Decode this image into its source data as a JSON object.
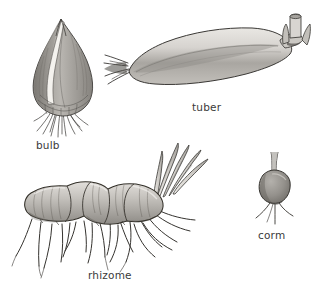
{
  "figure": {
    "background_color": "#ffffff",
    "label_color": "#3a3a3a",
    "ink_color": "#2b2b2b",
    "width": 313,
    "height": 290
  },
  "organs": [
    {
      "id": "bulb",
      "label": "bulb",
      "description": "Teardrop-shaped onion-like bulb with pointed apex, pale vertical split in the papery scales, and a dense tuft of fibrous roots at the flattened basal plate.",
      "fill_color": "#9a9a9a",
      "highlight_color": "#f2f0ec",
      "position": {
        "x": 30,
        "y": 18,
        "width": 62,
        "height": 122
      }
    },
    {
      "id": "tuber",
      "label": "tuber",
      "description": "Elongated horizontal swollen stem tuber with thin strap roots fanning from the left tip and short cut stem stubs rising at the upper right end.",
      "fill_color": "#c9c7c3",
      "highlight_color": "#eeece8",
      "position": {
        "x": 108,
        "y": 14,
        "width": 196,
        "height": 82
      }
    },
    {
      "id": "rhizome",
      "label": "rhizome",
      "description": "Horizontal segmented rhizome of three swollen internodes with constricted nodes, leaf shoots fanning up from the right tip, and many long wavy roots descending below.",
      "fill_color": "#bdbab5",
      "highlight_color": "#e8e6e2",
      "position": {
        "x": 20,
        "y": 140,
        "width": 185,
        "height": 130
      }
    },
    {
      "id": "corm",
      "label": "corm",
      "description": "Small rounded, slightly flattened corm with a thin stem rising from the crown and three spreading roots beneath.",
      "fill_color": "#97948f",
      "highlight_color": "#c9c6c1",
      "position": {
        "x": 258,
        "y": 168,
        "width": 30,
        "height": 58
      }
    }
  ]
}
